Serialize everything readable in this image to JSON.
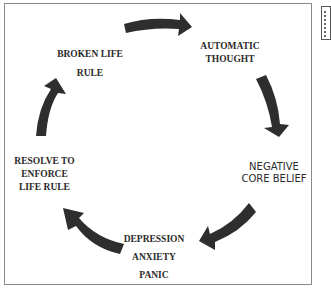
{
  "diagram": {
    "type": "cycle",
    "nodes": [
      {
        "id": "automatic-thought",
        "lines": [
          "AUTOMATIC",
          "THOUGHT"
        ]
      },
      {
        "id": "negative-core-belief",
        "lines": [
          "NEGATIVE",
          "CORE BELIEF"
        ]
      },
      {
        "id": "depression-anxiety-panic",
        "lines": [
          "DEPRESSION",
          "ANXIETY",
          "PANIC"
        ]
      },
      {
        "id": "resolve-to-enforce-life-rule",
        "lines": [
          "RESOLVE TO",
          "ENFORCE",
          "LIFE RULE"
        ]
      },
      {
        "id": "broken-life-rule",
        "lines": [
          "BROKEN LIFE",
          "RULE"
        ]
      }
    ],
    "edges": [
      {
        "from": "broken-life-rule",
        "to": "automatic-thought"
      },
      {
        "from": "automatic-thought",
        "to": "negative-core-belief"
      },
      {
        "from": "negative-core-belief",
        "to": "depression-anxiety-panic"
      },
      {
        "from": "depression-anxiety-panic",
        "to": "resolve-to-enforce-life-rule"
      },
      {
        "from": "resolve-to-enforce-life-rule",
        "to": "broken-life-rule"
      }
    ],
    "arrow_color": "#2e2e2e"
  }
}
